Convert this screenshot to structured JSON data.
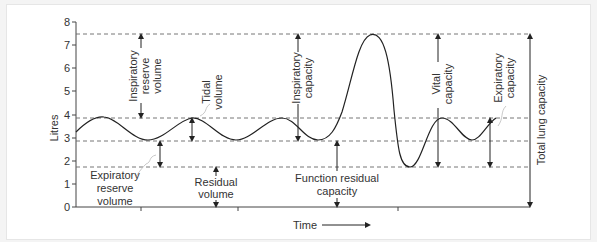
{
  "diagram": {
    "y_axis_label": "Litres",
    "y_ticks": [
      "0",
      "1",
      "2",
      "3",
      "4",
      "5",
      "6",
      "7",
      "8"
    ],
    "x_axis_label": "Time",
    "labels": {
      "irv_1": "Inspiratory",
      "irv_2": "reserve",
      "irv_3": "volume",
      "tv_1": "Tidal",
      "tv_2": "volume",
      "ic_1": "Inspiratory",
      "ic_2": "capacity",
      "vc_1": "Vital",
      "vc_2": "capacity",
      "ec_1": "Expiratory",
      "ec_2": "capacity",
      "tlc": "Total lung capacity",
      "erv_1": "Expiratory",
      "erv_2": "reserve",
      "erv_3": "volume",
      "rv_1": "Residual",
      "rv_2": "volume",
      "frc_1": "Function residual",
      "frc_2": "capacity"
    },
    "reference_levels_litres": [
      7.4,
      3.8,
      2.8,
      1.7
    ],
    "colors": {
      "line": "#333333",
      "dash": "#555555",
      "background": "#ffffff"
    }
  }
}
